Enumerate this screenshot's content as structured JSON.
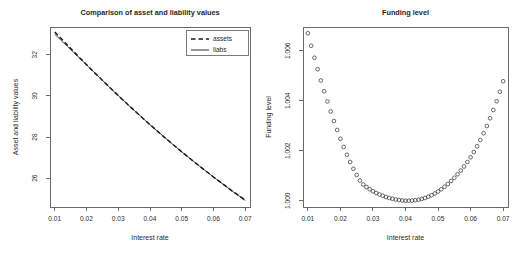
{
  "figure": {
    "background": "#ffffff",
    "width": 523,
    "height": 263,
    "axis_color": "#5a5a5a",
    "line_color": "#1a1a1a",
    "point_color": "#3a3a3a"
  },
  "chart_data": [
    {
      "panel": "left",
      "type": "line",
      "title": "Comparison of asset and liability values",
      "xlabel": "Interest rate",
      "ylabel": "Asset and liability values",
      "xlim": [
        0.0085,
        0.0715
      ],
      "ylim": [
        24.6,
        33.35
      ],
      "xticks": [
        0.01,
        0.02,
        0.03,
        0.04,
        0.05,
        0.06,
        0.07
      ],
      "xticklabels": [
        "0.01",
        "0.02",
        "0.03",
        "0.04",
        "0.05",
        "0.06",
        "0.07"
      ],
      "yticks": [
        26,
        28,
        30,
        32
      ],
      "yticklabels": [
        "26",
        "28",
        "30",
        "32"
      ],
      "grid": false,
      "legend_position": "top-right",
      "x": [
        0.01,
        0.011,
        0.012,
        0.013,
        0.014,
        0.015,
        0.016,
        0.017,
        0.018,
        0.019,
        0.02,
        0.021,
        0.022,
        0.023,
        0.024,
        0.025,
        0.026,
        0.027,
        0.028,
        0.029,
        0.03,
        0.031,
        0.032,
        0.033,
        0.034,
        0.035,
        0.036,
        0.037,
        0.038,
        0.039,
        0.04,
        0.041,
        0.042,
        0.043,
        0.044,
        0.045,
        0.046,
        0.047,
        0.048,
        0.049,
        0.05,
        0.051,
        0.052,
        0.053,
        0.054,
        0.055,
        0.056,
        0.057,
        0.058,
        0.059,
        0.06,
        0.061,
        0.062,
        0.063,
        0.064,
        0.065,
        0.066,
        0.067,
        0.068,
        0.069,
        0.07
      ],
      "series": [
        {
          "name": "assets",
          "style": "dashed",
          "values": [
            33.11,
            32.95,
            32.79,
            32.63,
            32.47,
            32.31,
            32.15,
            31.99,
            31.83,
            31.68,
            31.52,
            31.37,
            31.21,
            31.06,
            30.91,
            30.76,
            30.61,
            30.46,
            30.31,
            30.16,
            30.02,
            29.87,
            29.73,
            29.58,
            29.44,
            29.3,
            29.16,
            29.02,
            28.88,
            28.74,
            28.6,
            28.47,
            28.33,
            28.2,
            28.06,
            27.93,
            27.8,
            27.67,
            27.54,
            27.41,
            27.28,
            27.16,
            27.03,
            26.91,
            26.78,
            26.66,
            26.54,
            26.42,
            26.3,
            26.18,
            26.06,
            25.94,
            25.83,
            25.71,
            25.6,
            25.48,
            25.37,
            25.26,
            25.15,
            25.04,
            24.93
          ]
        },
        {
          "name": "liabs",
          "style": "solid",
          "values": [
            33.0,
            32.85,
            32.7,
            32.55,
            32.41,
            32.26,
            32.11,
            31.96,
            31.81,
            31.66,
            31.51,
            31.36,
            31.21,
            31.06,
            30.91,
            30.76,
            30.61,
            30.46,
            30.31,
            30.16,
            30.02,
            29.87,
            29.73,
            29.58,
            29.44,
            29.3,
            29.16,
            29.02,
            28.88,
            28.74,
            28.6,
            28.47,
            28.33,
            28.2,
            28.07,
            27.93,
            27.8,
            27.67,
            27.54,
            27.41,
            27.28,
            27.16,
            27.03,
            26.91,
            26.78,
            26.66,
            26.54,
            26.42,
            26.3,
            26.18,
            26.06,
            25.94,
            25.82,
            25.71,
            25.59,
            25.48,
            25.36,
            25.25,
            25.14,
            25.03,
            24.92
          ]
        }
      ],
      "legend": [
        {
          "label": "assets",
          "style": "dashed"
        },
        {
          "label": "liabs",
          "style": "solid"
        }
      ]
    },
    {
      "panel": "right",
      "type": "scatter",
      "title": "Funding level",
      "xlabel": "Interest rate",
      "ylabel": "Funding level",
      "xlim": [
        0.0085,
        0.0715
      ],
      "ylim": [
        0.99975,
        1.00695
      ],
      "xticks": [
        0.01,
        0.02,
        0.03,
        0.04,
        0.05,
        0.06,
        0.07
      ],
      "xticklabels": [
        "0.01",
        "0.02",
        "0.03",
        "0.04",
        "0.05",
        "0.06",
        "0.07"
      ],
      "yticks": [
        1.0,
        1.002,
        1.004,
        1.006
      ],
      "yticklabels": [
        "1.000",
        "1.002",
        "1.004",
        "1.006"
      ],
      "grid": false,
      "marker": "open-circle",
      "x": [
        0.01,
        0.011,
        0.012,
        0.013,
        0.014,
        0.015,
        0.016,
        0.017,
        0.018,
        0.019,
        0.02,
        0.021,
        0.022,
        0.023,
        0.024,
        0.025,
        0.026,
        0.027,
        0.028,
        0.029,
        0.03,
        0.031,
        0.032,
        0.033,
        0.034,
        0.035,
        0.036,
        0.037,
        0.038,
        0.039,
        0.04,
        0.041,
        0.042,
        0.043,
        0.044,
        0.045,
        0.046,
        0.047,
        0.048,
        0.049,
        0.05,
        0.051,
        0.052,
        0.053,
        0.054,
        0.055,
        0.056,
        0.057,
        0.058,
        0.059,
        0.06,
        0.061,
        0.062,
        0.063,
        0.064,
        0.065,
        0.066,
        0.067,
        0.068,
        0.069,
        0.07
      ],
      "y": [
        1.0067,
        1.0062,
        1.00572,
        1.00526,
        1.00481,
        1.00438,
        1.00397,
        1.00357,
        1.00319,
        1.00283,
        1.00248,
        1.00215,
        1.00184,
        1.00155,
        1.00128,
        1.00103,
        1.00081,
        1.00065,
        1.00055,
        1.00046,
        1.00038,
        1.00031,
        1.00025,
        1.0002,
        1.00015,
        1.00011,
        1.00008,
        1.00005,
        1.00003,
        1.00001,
        1.0,
        1.0,
        1.00001,
        1.00002,
        1.00004,
        1.00007,
        1.00011,
        1.00016,
        1.00022,
        1.00029,
        1.00037,
        1.00046,
        1.00056,
        1.00067,
        1.00079,
        1.00092,
        1.00106,
        1.00121,
        1.00137,
        1.00155,
        1.00174,
        1.00195,
        1.00218,
        1.00243,
        1.0027,
        1.00299,
        1.0033,
        1.00363,
        1.00398,
        1.00436,
        1.00478
      ]
    }
  ]
}
